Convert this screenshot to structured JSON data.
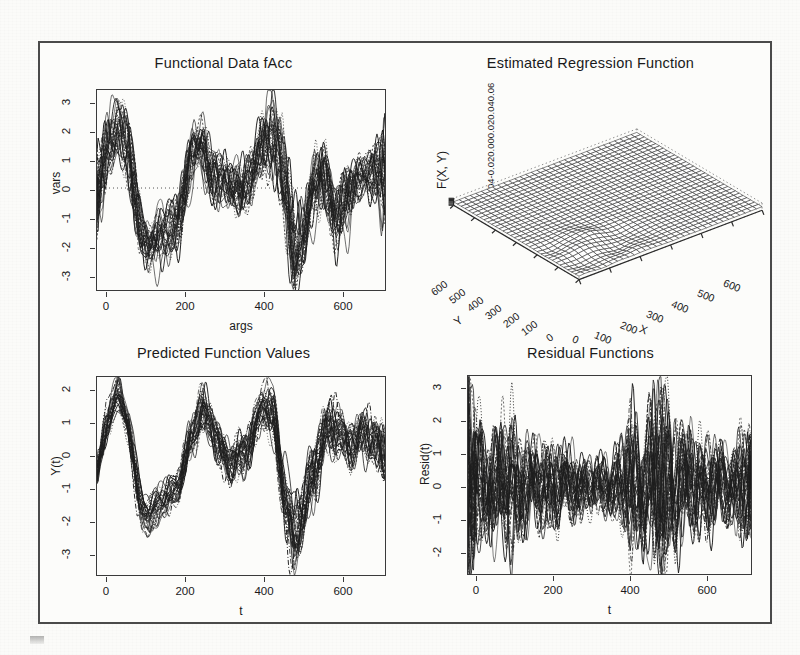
{
  "figure": {
    "background_color": "#fbfbf9",
    "frame_color": "#4a4a4a",
    "ink_color": "#1d1d1d"
  },
  "chart_data": [
    {
      "id": "functional-data-facc",
      "type": "line",
      "title": "Functional Data fAcc",
      "xlabel": "args",
      "ylabel": "vars",
      "xlim": [
        0,
        700
      ],
      "ylim": [
        -3.5,
        3.3
      ],
      "xticks": [
        0,
        200,
        400,
        600
      ],
      "yticks": [
        -3,
        -2,
        -1,
        0,
        1,
        2,
        3
      ],
      "grid": false,
      "legend": "none",
      "n_curves": 28,
      "description": "Overplotted accelerometer functional observations; strong oscillations, peaks near t=50 and t=250 and t=410, deep troughs near t=110 and t=470.",
      "series_summary": {
        "x": [
          0,
          25,
          50,
          75,
          100,
          125,
          150,
          175,
          200,
          225,
          250,
          275,
          300,
          325,
          350,
          375,
          400,
          425,
          450,
          475,
          500,
          525,
          550,
          575,
          600,
          625,
          650,
          675,
          700
        ],
        "mean": [
          -0.4,
          1.4,
          2.0,
          1.2,
          -1.1,
          -1.9,
          -1.6,
          -1.4,
          -0.8,
          0.9,
          1.5,
          0.5,
          0.2,
          0.1,
          0.0,
          0.4,
          1.5,
          1.8,
          0.3,
          -2.2,
          -1.4,
          0.1,
          0.4,
          -0.9,
          -0.5,
          0.3,
          0.5,
          0.4,
          0.3
        ],
        "upper": [
          0.9,
          2.4,
          2.6,
          2.2,
          -0.2,
          -1.1,
          -0.8,
          -0.5,
          0.2,
          1.8,
          2.2,
          1.4,
          1.0,
          0.9,
          0.9,
          1.4,
          2.4,
          3.2,
          1.8,
          -1.0,
          -0.2,
          1.2,
          1.6,
          0.5,
          0.6,
          1.0,
          1.2,
          1.6,
          3.0
        ],
        "lower": [
          -1.8,
          0.2,
          1.2,
          -0.2,
          -2.1,
          -2.5,
          -2.4,
          -2.2,
          -1.8,
          -0.3,
          0.6,
          -0.6,
          -0.7,
          -0.8,
          -0.9,
          -0.6,
          0.4,
          0.6,
          -1.3,
          -3.4,
          -2.6,
          -1.2,
          -0.6,
          -2.2,
          -1.6,
          -0.5,
          -0.2,
          -0.5,
          -1.2
        ]
      }
    },
    {
      "id": "estimated-regression-function",
      "type": "surface",
      "title": "Estimated Regression Function",
      "xlabel": "X",
      "ylabel": "Y",
      "zlabel": "F(X, Y)",
      "xticks": [
        0,
        100,
        200,
        300,
        400,
        500,
        600
      ],
      "yticks": [
        0,
        100,
        200,
        300,
        400,
        500,
        600
      ],
      "zticks": [
        "-0.06",
        "-0.04",
        "-0.02",
        "0.00",
        "0.02",
        "0.04",
        "0.06"
      ],
      "zlim": [
        -0.06,
        0.06
      ],
      "grid": true,
      "legend": "none",
      "description": "Perspective wireframe mesh of bivariate regression surface; flat near zero over most of the domain with a cluster of sharp positive ridges and negative valleys concentrated near small X and small Y (roughly X<250, Y<250)."
    },
    {
      "id": "predicted-function-values",
      "type": "line",
      "title": "Predicted Function Values",
      "xlabel": "t",
      "ylabel": "Y(t)",
      "xlim": [
        0,
        700
      ],
      "ylim": [
        -3.3,
        2.1
      ],
      "xticks": [
        0,
        200,
        400,
        600
      ],
      "yticks": [
        -3,
        -2,
        -1,
        0,
        1,
        2
      ],
      "grid": false,
      "legend": "none",
      "n_curves": 28,
      "description": "Tightly bundled predicted curves; common peak ~1.6 near t=55, trough ~-1.9 near t=120, ridge ~1.3 near t=260, deep trough ~-3.0 near t=480.",
      "series_summary": {
        "x": [
          0,
          25,
          50,
          75,
          100,
          125,
          150,
          175,
          200,
          225,
          250,
          275,
          300,
          325,
          350,
          375,
          400,
          425,
          450,
          475,
          500,
          525,
          550,
          575,
          600,
          625,
          650,
          675,
          700
        ],
        "mean": [
          -0.5,
          0.9,
          1.6,
          0.9,
          -1.1,
          -1.8,
          -1.2,
          -1.1,
          -0.8,
          0.4,
          1.2,
          0.8,
          0.1,
          -0.2,
          -0.1,
          0.5,
          1.4,
          1.0,
          -0.8,
          -2.3,
          -1.5,
          -0.3,
          0.6,
          0.7,
          0.3,
          0.4,
          0.5,
          0.3,
          -0.1
        ],
        "upper": [
          -0.2,
          1.3,
          1.8,
          1.3,
          -0.7,
          -1.5,
          -0.8,
          -0.7,
          -0.3,
          1.0,
          1.9,
          1.4,
          0.7,
          0.4,
          0.5,
          1.1,
          1.8,
          1.7,
          0.2,
          -1.4,
          -0.6,
          0.6,
          1.3,
          1.4,
          0.9,
          1.0,
          1.2,
          1.0,
          0.6
        ],
        "lower": [
          -0.8,
          0.5,
          1.3,
          0.4,
          -1.6,
          -2.1,
          -1.6,
          -1.5,
          -1.2,
          -0.1,
          0.7,
          0.2,
          -0.5,
          -0.8,
          -0.8,
          -0.1,
          0.9,
          0.3,
          -1.7,
          -3.1,
          -2.3,
          -1.3,
          -0.2,
          -0.1,
          -0.4,
          -0.3,
          -0.2,
          -0.5,
          -0.8
        ]
      }
    },
    {
      "id": "residual-functions",
      "type": "line",
      "title": "Residual Functions",
      "xlabel": "t",
      "ylabel": "Resid(t)",
      "xlim": [
        0,
        700
      ],
      "ylim": [
        -2.5,
        3.0
      ],
      "xticks": [
        0,
        200,
        400,
        600
      ],
      "yticks": [
        -2,
        -1,
        0,
        1,
        2,
        3
      ],
      "grid": false,
      "legend": "none",
      "n_curves": 28,
      "description": "Residual curves fluctuating about zero; largest spread at t near 0 (range -2.4 to 2.8), a secondary burst near t=470-500 (up to 2.6) and a spike at the right boundary t=700.",
      "series_summary": {
        "x": [
          0,
          25,
          50,
          75,
          100,
          125,
          150,
          175,
          200,
          225,
          250,
          275,
          300,
          325,
          350,
          375,
          400,
          425,
          450,
          475,
          500,
          525,
          550,
          575,
          600,
          625,
          650,
          675,
          700
        ],
        "mean": [
          0.1,
          0.0,
          0.0,
          0.0,
          0.0,
          0.0,
          0.0,
          0.0,
          0.0,
          0.0,
          0.0,
          0.0,
          0.0,
          0.0,
          0.0,
          0.0,
          0.0,
          0.0,
          0.0,
          0.0,
          0.0,
          0.0,
          0.0,
          0.0,
          0.0,
          0.0,
          0.0,
          0.0,
          0.0
        ],
        "upper": [
          2.8,
          1.5,
          1.2,
          1.3,
          1.7,
          1.2,
          1.0,
          1.0,
          0.9,
          1.0,
          0.8,
          0.7,
          0.6,
          0.6,
          0.7,
          0.9,
          1.7,
          1.3,
          1.6,
          2.6,
          1.7,
          1.3,
          1.2,
          1.1,
          1.0,
          0.9,
          0.9,
          1.2,
          1.9
        ],
        "lower": [
          -2.4,
          -1.6,
          -1.2,
          -1.3,
          -1.6,
          -1.1,
          -1.0,
          -1.0,
          -0.9,
          -0.9,
          -0.8,
          -0.7,
          -0.6,
          -0.6,
          -0.7,
          -0.9,
          -1.5,
          -1.3,
          -2.2,
          -2.3,
          -1.6,
          -1.3,
          -1.2,
          -1.1,
          -1.0,
          -0.9,
          -0.9,
          -1.1,
          -0.9
        ]
      }
    }
  ]
}
